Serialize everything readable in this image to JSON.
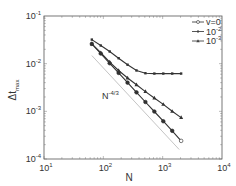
{
  "chart_data": {
    "type": "line",
    "title": "",
    "xlabel": "N",
    "ylabel": "Δt_max",
    "xscale": "log",
    "yscale": "log",
    "xlim": [
      10,
      10000
    ],
    "ylim": [
      0.0001,
      0.1
    ],
    "x_ticks": [
      {
        "base": "10",
        "exp": "1"
      },
      {
        "base": "10",
        "exp": "2"
      },
      {
        "base": "10",
        "exp": "3"
      },
      {
        "base": "10",
        "exp": "4"
      }
    ],
    "y_ticks": [
      {
        "base": "10",
        "exp": "-4"
      },
      {
        "base": "10",
        "exp": "-3"
      },
      {
        "base": "10",
        "exp": "-2"
      },
      {
        "base": "10",
        "exp": "-1"
      }
    ],
    "grid": false,
    "legend_position": "upper right",
    "x": [
      64,
      90.5,
      128,
      181,
      256,
      362,
      512,
      724,
      1024,
      1448,
      2048
    ],
    "series": [
      {
        "name": "ν=0",
        "legend_label": "v=0",
        "marker": "circle",
        "values": [
          0.026,
          0.0163,
          0.0102,
          0.0064,
          0.004,
          0.0025,
          0.00157,
          0.00099,
          0.00062,
          0.00039,
          0.00024
        ]
      },
      {
        "name": "ν=10^-2",
        "legend_label": "10",
        "legend_exp": "-2",
        "marker": "square",
        "values": [
          0.032,
          0.024,
          0.018,
          0.013,
          0.0095,
          0.0072,
          0.0063,
          0.0062,
          0.0062,
          0.0062,
          0.0062
        ]
      },
      {
        "name": "ν=10^-3",
        "legend_label": "10",
        "legend_exp": "-3",
        "marker": "triangle",
        "values": [
          0.026,
          0.017,
          0.0108,
          0.0072,
          0.005,
          0.0036,
          0.0026,
          0.0019,
          0.0014,
          0.001,
          0.00074
        ]
      }
    ],
    "reference_line": {
      "label": "N",
      "label_exp": "-4/3",
      "x": [
        64,
        1900
      ],
      "values": [
        0.0148,
        0.000158
      ],
      "style": "thin gray"
    },
    "annotations": [
      {
        "text": "N^-4/3",
        "x": 100,
        "y": 0.0022
      }
    ]
  }
}
